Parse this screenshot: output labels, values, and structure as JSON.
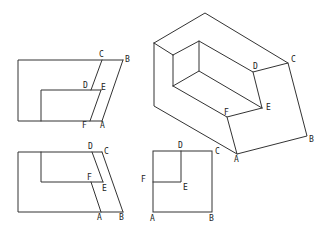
{
  "figure": {
    "views": {
      "front_view": {
        "labels": [
          {
            "text": "C",
            "x": 99,
            "y": 57
          },
          {
            "text": "B",
            "x": 125,
            "y": 62
          },
          {
            "text": "D",
            "x": 83,
            "y": 88
          },
          {
            "text": "E",
            "x": 101,
            "y": 90
          },
          {
            "text": "F",
            "x": 82,
            "y": 128
          },
          {
            "text": "A",
            "x": 100,
            "y": 128
          }
        ]
      },
      "top_view": {
        "labels": [
          {
            "text": "D",
            "x": 88,
            "y": 149
          },
          {
            "text": "C",
            "x": 104,
            "y": 154
          },
          {
            "text": "F",
            "x": 87,
            "y": 180
          },
          {
            "text": "E",
            "x": 102,
            "y": 191
          },
          {
            "text": "A",
            "x": 97,
            "y": 220
          },
          {
            "text": "B",
            "x": 119,
            "y": 220
          }
        ]
      },
      "side_view": {
        "labels": [
          {
            "text": "D",
            "x": 178,
            "y": 148
          },
          {
            "text": "C",
            "x": 215,
            "y": 154
          },
          {
            "text": "F",
            "x": 141,
            "y": 182
          },
          {
            "text": "E",
            "x": 183,
            "y": 190
          },
          {
            "text": "A",
            "x": 150,
            "y": 221
          },
          {
            "text": "B",
            "x": 209,
            "y": 221
          }
        ]
      },
      "isometric_view": {
        "labels": [
          {
            "text": "D",
            "x": 253,
            "y": 69
          },
          {
            "text": "C",
            "x": 291,
            "y": 62
          },
          {
            "text": "E",
            "x": 266,
            "y": 110
          },
          {
            "text": "F",
            "x": 224,
            "y": 115
          },
          {
            "text": "B",
            "x": 309,
            "y": 142
          },
          {
            "text": "A",
            "x": 234,
            "y": 162
          }
        ]
      }
    }
  }
}
